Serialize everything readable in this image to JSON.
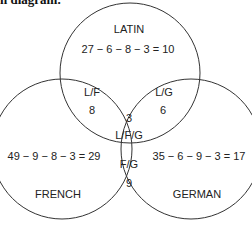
{
  "header_fragment": "n diagram.",
  "diagram": {
    "circles": [
      {
        "name": "LATIN",
        "cx": 130,
        "cy": 73,
        "r": 70
      },
      {
        "name": "FRENCH",
        "cx": 62,
        "cy": 149,
        "r": 70
      },
      {
        "name": "GERMAN",
        "cx": 191,
        "cy": 149,
        "r": 70
      }
    ],
    "labels": {
      "latin_title": "LATIN",
      "latin_calc": "27 − 6 − 8 − 3 = 10",
      "lf_title": "L/F",
      "lf_value": "8",
      "lg_title": "L/G",
      "lg_value": "6",
      "lfg_value": "3",
      "lfg_title": "L/F/G",
      "french_calc": "49 − 9 − 8 − 3 = 29",
      "german_calc": "35 − 6 − 9 − 3 = 17",
      "fg_title": "F/G",
      "fg_value": "9",
      "french_title": "FRENCH",
      "german_title": "GERMAN"
    }
  }
}
